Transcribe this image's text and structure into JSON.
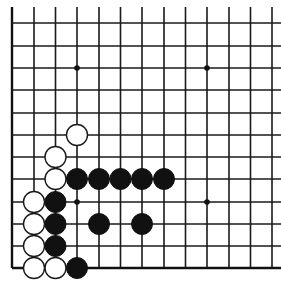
{
  "diagram": {
    "type": "go-board-fragment",
    "visible_columns": 13,
    "visible_rows": 12,
    "edges_shown": [
      "left",
      "bottom"
    ],
    "colors": {
      "line": "#1a1a1a",
      "black_stone": "#111111",
      "white_stone": "#ffffff",
      "background": "#ffffff"
    },
    "geometry": {
      "col_x": [
        12,
        34,
        55.5,
        77,
        99,
        120.5,
        142,
        164,
        185.5,
        207,
        229,
        250.5,
        272
      ],
      "row_y": [
        268,
        246,
        224,
        202,
        179,
        157,
        135,
        113,
        90,
        68,
        46,
        23
      ],
      "line_top_extent": 7,
      "line_right_extent": 281,
      "stone_radius": 10.5
    },
    "hoshi": [
      {
        "col": 3,
        "row": 3
      },
      {
        "col": 9,
        "row": 3
      },
      {
        "col": 3,
        "row": 9
      },
      {
        "col": 9,
        "row": 9
      }
    ],
    "stones": [
      {
        "color": "white",
        "col": 3,
        "row": 6
      },
      {
        "color": "white",
        "col": 2,
        "row": 5
      },
      {
        "color": "white",
        "col": 2,
        "row": 4
      },
      {
        "color": "black",
        "col": 3,
        "row": 4
      },
      {
        "color": "black",
        "col": 4,
        "row": 4
      },
      {
        "color": "black",
        "col": 5,
        "row": 4
      },
      {
        "color": "black",
        "col": 6,
        "row": 4
      },
      {
        "color": "black",
        "col": 7,
        "row": 4
      },
      {
        "color": "white",
        "col": 1,
        "row": 3
      },
      {
        "color": "black",
        "col": 2,
        "row": 3
      },
      {
        "color": "white",
        "col": 1,
        "row": 2
      },
      {
        "color": "black",
        "col": 2,
        "row": 2
      },
      {
        "color": "black",
        "col": 4,
        "row": 2
      },
      {
        "color": "black",
        "col": 6,
        "row": 2
      },
      {
        "color": "white",
        "col": 1,
        "row": 1
      },
      {
        "color": "black",
        "col": 2,
        "row": 1
      },
      {
        "color": "white",
        "col": 1,
        "row": 0
      },
      {
        "color": "white",
        "col": 2,
        "row": 0
      },
      {
        "color": "black",
        "col": 3,
        "row": 0
      }
    ]
  }
}
